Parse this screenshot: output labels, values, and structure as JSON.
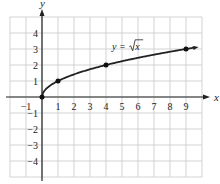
{
  "chart_data": {
    "type": "line",
    "title": "",
    "xlabel": "x",
    "ylabel": "y",
    "xlim": [
      -2,
      10
    ],
    "ylim": [
      -5,
      5
    ],
    "grid": true,
    "x_ticks": [
      -1,
      1,
      2,
      3,
      4,
      5,
      6,
      7,
      8,
      9
    ],
    "y_ticks": [
      4,
      3,
      2,
      1,
      -1,
      -2,
      -3,
      -4
    ],
    "series": [
      {
        "name": "y = √x",
        "function": "sqrt(x)",
        "domain": [
          0,
          9.6
        ]
      }
    ],
    "points": [
      {
        "x": 0,
        "y": 0
      },
      {
        "x": 1,
        "y": 1
      },
      {
        "x": 4,
        "y": 2
      },
      {
        "x": 9,
        "y": 3
      }
    ],
    "annotations": [
      {
        "text_prefix": "y = ",
        "text_radicand": "x",
        "near": {
          "x": 5,
          "y": 3.2
        }
      }
    ]
  }
}
